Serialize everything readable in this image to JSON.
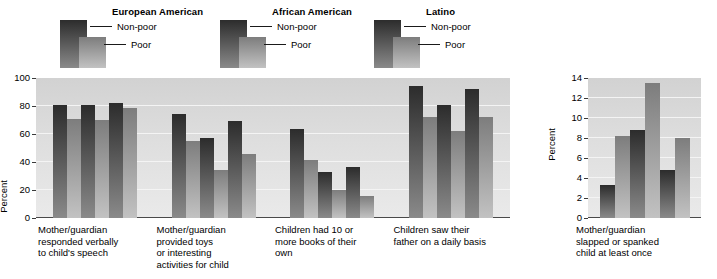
{
  "figure": {
    "legend_groups": [
      {
        "title": "European American",
        "non_poor_label": "Non-poor",
        "poor_label": "Poor"
      },
      {
        "title": "African American",
        "non_poor_label": "Non-poor",
        "poor_label": "Poor"
      },
      {
        "title": "Latino",
        "non_poor_label": "Non-poor",
        "poor_label": "Poor"
      }
    ],
    "colors": {
      "non_poor_top": "#2c2c2c",
      "non_poor_bottom": "#8a8a8a",
      "poor_top": "#7d7d7d",
      "poor_bottom": "#c2c2c2",
      "plot_background": "#dcdcdc",
      "gridline": "#f4f4f4",
      "axis": "#3a3a3a"
    }
  },
  "chart_data": [
    {
      "type": "bar",
      "title": "",
      "xlabel": "",
      "ylabel": "Percent",
      "ylim": [
        0,
        100
      ],
      "yticks": [
        0,
        20,
        40,
        60,
        80,
        100
      ],
      "grid": true,
      "legend_position": "above",
      "categories": [
        "Mother/guardian\nresponded verbally\nto child's speech",
        "Mother/guardian\nprovided toys\nor interesting\nactivities for child",
        "Children had 10 or\nmore books of their\nown",
        "Children saw their\nfather on a daily basis"
      ],
      "series": [
        {
          "name": "European American Non-poor",
          "values": [
            81,
            74,
            63.5,
            94
          ]
        },
        {
          "name": "European American Poor",
          "values": [
            71,
            55,
            41.5,
            72
          ]
        },
        {
          "name": "African American Non-poor",
          "values": [
            81,
            57.5,
            33,
            81
          ]
        },
        {
          "name": "African American Poor",
          "values": [
            70,
            34.5,
            20,
            62
          ]
        },
        {
          "name": "Latino Non-poor",
          "values": [
            82,
            69,
            36.5,
            92
          ]
        },
        {
          "name": "Latino Poor",
          "values": [
            78.5,
            46,
            16,
            72
          ]
        }
      ]
    },
    {
      "type": "bar",
      "title": "",
      "xlabel": "",
      "ylabel": "Percent",
      "ylim": [
        0,
        14
      ],
      "yticks": [
        0,
        2,
        4,
        6,
        8,
        10,
        12,
        14
      ],
      "grid": true,
      "legend_position": "above",
      "categories": [
        "Mother/guardian\nslapped or spanked\nchild at least once"
      ],
      "series": [
        {
          "name": "European American Non-poor",
          "values": [
            3.3
          ]
        },
        {
          "name": "European American Poor",
          "values": [
            8.2
          ]
        },
        {
          "name": "African American Non-poor",
          "values": [
            8.8
          ]
        },
        {
          "name": "African American Poor",
          "values": [
            13.5
          ]
        },
        {
          "name": "Latino Non-poor",
          "values": [
            4.8
          ]
        },
        {
          "name": "Latino Poor",
          "values": [
            8.0
          ]
        }
      ]
    }
  ]
}
